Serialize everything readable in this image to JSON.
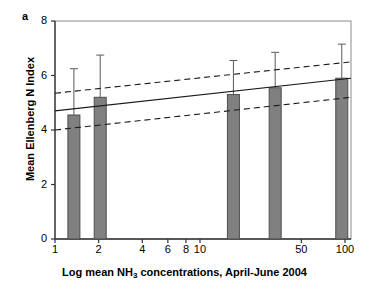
{
  "panel": {
    "label": "a"
  },
  "chart_data": {
    "type": "bar",
    "title": "",
    "subtitle": "",
    "xlabel": "Log mean NH3 concentrations, April-June 2004",
    "xlabel_parts": {
      "pre": "Log mean NH",
      "sub": "3",
      "post": " concentrations, April-June 2004"
    },
    "ylabel": "Mean Ellenberg N Index",
    "xscale": "log",
    "xlim": [
      1,
      110
    ],
    "ylim": [
      0,
      8
    ],
    "yticks": [
      0,
      2,
      4,
      6,
      8
    ],
    "ytick_labels": [
      "0",
      "2",
      "4",
      "6",
      "8"
    ],
    "xticks": [
      1,
      2,
      4,
      6,
      8,
      10,
      50,
      100
    ],
    "xtick_labels": [
      "1",
      "2",
      "4",
      "6",
      "8",
      "10",
      "50",
      "100"
    ],
    "grid": false,
    "legend": "none",
    "bar_color": "#808080",
    "bar_edge_color": "#4d4d4d",
    "x": [
      1.35,
      2.05,
      17.0,
      33.0,
      95.0
    ],
    "values": [
      4.55,
      5.2,
      5.3,
      5.55,
      5.9
    ],
    "errors_upper": [
      6.25,
      6.75,
      6.55,
      6.85,
      7.15
    ],
    "error_label": "standard deviation whisker (upper only)",
    "series": [
      {
        "name": "Mean Ellenberg N Index",
        "categories": [
          "1.35",
          "2.05",
          "17",
          "33",
          "95"
        ],
        "values": [
          4.55,
          5.2,
          5.3,
          5.55,
          5.9
        ]
      }
    ],
    "regression_line": {
      "style": "solid",
      "x": [
        1,
        110
      ],
      "y": [
        4.7,
        5.9
      ]
    },
    "confidence_bands": [
      {
        "name": "upper-95",
        "style": "dashed",
        "x": [
          1,
          110
        ],
        "y": [
          5.35,
          6.5
        ]
      },
      {
        "name": "lower-95",
        "style": "dashed",
        "x": [
          1,
          110
        ],
        "y": [
          4.0,
          5.2
        ]
      }
    ]
  }
}
